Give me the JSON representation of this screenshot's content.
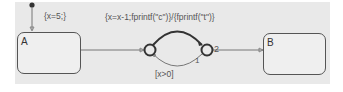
{
  "diagram": {
    "type": "stateflow-chart",
    "states": [
      {
        "id": "A",
        "name": "A"
      },
      {
        "id": "B",
        "name": "B"
      }
    ],
    "junctions": [
      {
        "id": "j1"
      },
      {
        "id": "j2"
      }
    ],
    "default_transition": {
      "label": "{x=5;}"
    },
    "transitions": [
      {
        "from": "A",
        "to": "j1",
        "label": ""
      },
      {
        "from": "j1",
        "to": "j2",
        "label": "{x=x-1;fprintf(\"c\")}/{fprintf(\"t\")}",
        "order": "2"
      },
      {
        "from": "j2",
        "to": "j1",
        "label": "[x>0]",
        "order": "1"
      },
      {
        "from": "j2",
        "to": "B",
        "label": ""
      }
    ],
    "colors": {
      "canvas": "#e9e9e9",
      "stroke": "#555555",
      "text": "#555555"
    }
  }
}
